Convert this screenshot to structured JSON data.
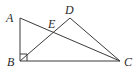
{
  "diagram": {
    "type": "geometry-figure",
    "points": {
      "A": {
        "label": "A"
      },
      "B": {
        "label": "B"
      },
      "C": {
        "label": "C"
      },
      "D": {
        "label": "D"
      },
      "E": {
        "label": "E"
      }
    },
    "segments": [
      {
        "name": "AB",
        "from": "A",
        "to": "B"
      },
      {
        "name": "BC",
        "from": "B",
        "to": "C"
      },
      {
        "name": "AC",
        "from": "A",
        "to": "C"
      },
      {
        "name": "BD",
        "from": "B",
        "to": "D"
      },
      {
        "name": "DC",
        "from": "D",
        "to": "C"
      }
    ],
    "right_angle_at": "B",
    "intersection": {
      "point": "E",
      "of": [
        "AC",
        "BD"
      ]
    },
    "colors": {
      "stroke": "#3a3a3a",
      "text": "#2a2a2a"
    }
  }
}
